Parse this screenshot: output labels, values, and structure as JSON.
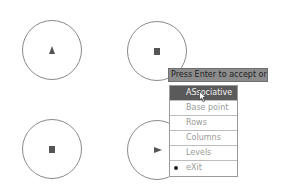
{
  "canvas": {
    "circles": [
      {
        "id": "top-left",
        "glyph": "triangle-up"
      },
      {
        "id": "top-right",
        "glyph": "square"
      },
      {
        "id": "bottom-left",
        "glyph": "square"
      },
      {
        "id": "bottom-right",
        "glyph": "triangle-right"
      }
    ]
  },
  "tooltip": {
    "text": "Press Enter to accept or"
  },
  "context_menu": {
    "items": [
      {
        "label": "ASsociative",
        "state": "highlighted"
      },
      {
        "label": "Base point",
        "state": "normal"
      },
      {
        "label": "Rows",
        "state": "normal"
      },
      {
        "label": "Columns",
        "state": "normal"
      },
      {
        "label": "Levels",
        "state": "normal"
      },
      {
        "label": "eXit",
        "state": "default"
      }
    ]
  },
  "colors": {
    "highlight": "#5a5a5a",
    "tooltip_bg": "#8c8c8c",
    "item_text": "#9a9a9a"
  }
}
